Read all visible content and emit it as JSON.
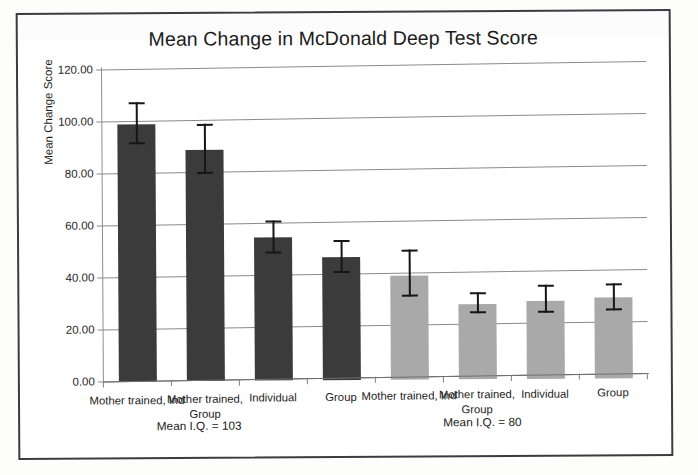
{
  "figure": {
    "title": "Mean Change in McDonald Deep Test Score",
    "y_axis_title": "Mean Change Score",
    "group_notes": [
      {
        "label": "Mean I.Q. = 103",
        "center_pct": 27.5
      },
      {
        "label": "Mean I.Q. = 80",
        "center_pct": 71.0
      }
    ]
  },
  "chart_data": {
    "type": "bar",
    "title": "Mean Change in McDonald Deep Test Score",
    "xlabel": "",
    "ylabel": "Mean Change Score",
    "ylim": [
      0,
      120
    ],
    "ytick_labels": [
      "0.00",
      "20.00",
      "40.00",
      "60.00",
      "80.00",
      "100.00",
      "120.00"
    ],
    "ytick_values": [
      0,
      20,
      40,
      60,
      80,
      100,
      120
    ],
    "grid": true,
    "legend": "none",
    "categories": [
      "Mother trained, Ind",
      "Mother trained, Group",
      "Individual",
      "Group",
      "Mother trained, Ind",
      "Mother trained, Group",
      "Individual",
      "Group"
    ],
    "values": [
      99.0,
      89.0,
      55.0,
      47.5,
      40.0,
      29.0,
      30.0,
      31.0
    ],
    "error_upper": [
      107.5,
      99.0,
      61.5,
      54.0,
      50.0,
      33.5,
      36.0,
      36.5
    ],
    "error_lower": [
      91.0,
      79.5,
      49.0,
      41.0,
      32.0,
      25.5,
      25.5,
      26.0
    ],
    "bar_colors": [
      "#3b3b3b",
      "#3b3b3b",
      "#3b3b3b",
      "#3b3b3b",
      "#a9a9a9",
      "#a9a9a9",
      "#a9a9a9",
      "#a9a9a9"
    ],
    "groups": [
      {
        "label": "Mean I.Q. = 103",
        "categories": [
          0,
          1,
          2,
          3
        ]
      },
      {
        "label": "Mean I.Q. = 80",
        "categories": [
          4,
          5,
          6,
          7
        ]
      }
    ],
    "annotations": [
      "Mean I.Q. = 103",
      "Mean I.Q. = 80"
    ]
  }
}
